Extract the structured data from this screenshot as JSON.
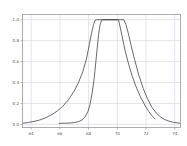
{
  "chart_data": {
    "type": "line",
    "title": "",
    "xlabel": "",
    "ylabel": "",
    "xlim": [
      63.4,
      74.4
    ],
    "ylim": [
      -0.03,
      1.05
    ],
    "grid": true,
    "legend": false,
    "xticks": [
      64,
      66,
      68,
      70,
      72,
      74
    ],
    "xtick_labels": [
      "64",
      "66",
      "68",
      "70",
      "72",
      "74"
    ],
    "yticks": [
      0.0,
      0.2,
      0.4,
      0.6,
      0.8,
      1.0
    ],
    "ytick_labels": [
      "0.0",
      "0.2",
      "0.4",
      "0.6",
      "0.8",
      "1.0"
    ],
    "series": [
      {
        "name": "wide-saturation-curve",
        "color": "#3a3a3a",
        "points": [
          [
            63.45,
            0.012
          ],
          [
            63.8,
            0.018
          ],
          [
            64.2,
            0.028
          ],
          [
            64.6,
            0.042
          ],
          [
            65.0,
            0.062
          ],
          [
            65.4,
            0.09
          ],
          [
            65.8,
            0.125
          ],
          [
            66.2,
            0.172
          ],
          [
            66.6,
            0.235
          ],
          [
            67.0,
            0.32
          ],
          [
            67.3,
            0.4
          ],
          [
            67.6,
            0.505
          ],
          [
            67.85,
            0.625
          ],
          [
            68.05,
            0.76
          ],
          [
            68.2,
            0.87
          ],
          [
            68.35,
            0.955
          ],
          [
            68.45,
            0.995
          ],
          [
            68.55,
            1.0
          ],
          [
            69.5,
            1.0
          ],
          [
            70.2,
            1.0
          ],
          [
            70.45,
            1.0
          ],
          [
            70.6,
            0.955
          ],
          [
            70.75,
            0.88
          ],
          [
            70.95,
            0.76
          ],
          [
            71.2,
            0.62
          ],
          [
            71.5,
            0.47
          ],
          [
            71.8,
            0.345
          ],
          [
            72.1,
            0.245
          ],
          [
            72.4,
            0.165
          ],
          [
            72.7,
            0.11
          ],
          [
            73.0,
            0.072
          ],
          [
            73.3,
            0.046
          ],
          [
            73.6,
            0.03
          ],
          [
            73.9,
            0.02
          ],
          [
            74.2,
            0.014
          ],
          [
            74.35,
            0.012
          ]
        ]
      },
      {
        "name": "narrow-saturation-curve",
        "color": "#3a3a3a",
        "points": [
          [
            65.95,
            0.01
          ],
          [
            66.3,
            0.011
          ],
          [
            66.7,
            0.013
          ],
          [
            67.0,
            0.017
          ],
          [
            67.3,
            0.026
          ],
          [
            67.55,
            0.042
          ],
          [
            67.75,
            0.07
          ],
          [
            67.95,
            0.12
          ],
          [
            68.1,
            0.19
          ],
          [
            68.25,
            0.3
          ],
          [
            68.4,
            0.45
          ],
          [
            68.5,
            0.59
          ],
          [
            68.6,
            0.73
          ],
          [
            68.7,
            0.86
          ],
          [
            68.8,
            0.95
          ],
          [
            68.9,
            0.992
          ],
          [
            69.0,
            1.0
          ],
          [
            69.6,
            1.0
          ],
          [
            70.0,
            1.0
          ],
          [
            70.1,
            0.99
          ],
          [
            70.2,
            0.93
          ],
          [
            70.35,
            0.83
          ],
          [
            70.55,
            0.7
          ],
          [
            70.8,
            0.57
          ],
          [
            71.05,
            0.455
          ],
          [
            71.35,
            0.345
          ],
          [
            71.65,
            0.252
          ],
          [
            71.95,
            0.175
          ],
          [
            72.2,
            0.12
          ],
          [
            72.4,
            0.085
          ],
          [
            72.55,
            0.062
          ],
          [
            72.62,
            0.052
          ]
        ]
      }
    ]
  },
  "axes": {
    "frame_color": "#999999",
    "grid_color": "#d8d8e8",
    "tick_label_color": "#555555"
  }
}
